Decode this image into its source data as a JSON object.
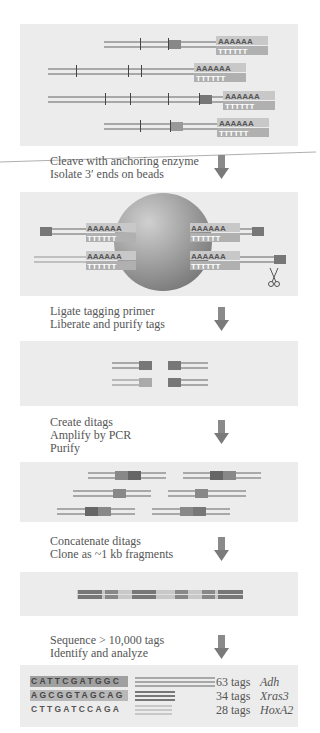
{
  "steps": [
    {
      "line1": "Cleave with anchoring enzyme",
      "line2": "Isolate 3′ ends on beads"
    },
    {
      "line1": "Ligate tagging primer",
      "line2": "Liberate and purify tags"
    },
    {
      "line1": "Create ditags",
      "line2": "Amplify by PCR",
      "line3": "Purify"
    },
    {
      "line1": "Concatenate ditags",
      "line2": "Clone as ~1 kb fragments"
    },
    {
      "line1": "Sequence > 10,000 tags",
      "line2": "Identify and analyze"
    }
  ],
  "polyA": "A A A A A A",
  "polyT": "T T T T T T",
  "results": [
    {
      "sequence": "CATTCGATGGC",
      "count": "63 tags",
      "gene": "Adh"
    },
    {
      "sequence": "AGCGGTAGCAG",
      "count": "34 tags",
      "gene": "Xras3"
    },
    {
      "sequence": "CTTGATCCAGA",
      "count": "28 tags",
      "gene": "HoxA2"
    }
  ],
  "icons": {
    "arrow": "down-arrow-icon",
    "scissors": "scissors-icon",
    "bead": "bead-icon"
  },
  "colors": {
    "panel_bg": "#ececec",
    "strand": "#a8a8a8",
    "tag_dark": "#707070",
    "bead": "#888888",
    "box": "#b0b0b0",
    "text": "#555555"
  }
}
